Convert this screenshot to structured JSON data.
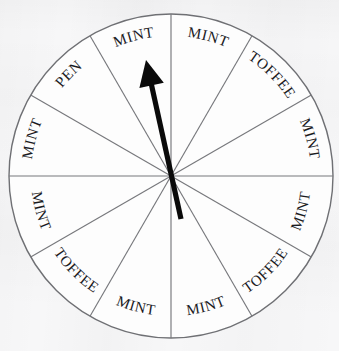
{
  "page": {
    "background_color": "#f7f7f8",
    "ink_color": "#1b1b1f",
    "line_color": "#6f7074",
    "arrow_color": "#0a0a0a"
  },
  "wheel": {
    "name": "prize-spinner-wheel",
    "center_x": 171,
    "center_y": 176,
    "radius": 162,
    "sector_count": 12,
    "sector_angle_degrees": 30,
    "outline_color": "#6f7074",
    "fill_color": "#fdfdfd",
    "sectors": [
      {
        "index": 1,
        "label": "MINT",
        "start_deg": 0,
        "end_deg": 30
      },
      {
        "index": 2,
        "label": "TOFFEE",
        "start_deg": 30,
        "end_deg": 60
      },
      {
        "index": 3,
        "label": "MINT",
        "start_deg": 60,
        "end_deg": 90
      },
      {
        "index": 4,
        "label": "MINT",
        "start_deg": 90,
        "end_deg": 120
      },
      {
        "index": 5,
        "label": "TOFFEE",
        "start_deg": 120,
        "end_deg": 150
      },
      {
        "index": 6,
        "label": "MINT",
        "start_deg": 150,
        "end_deg": 180
      },
      {
        "index": 7,
        "label": "MINT",
        "start_deg": 180,
        "end_deg": 210
      },
      {
        "index": 8,
        "label": "TOFFEE",
        "start_deg": 210,
        "end_deg": 240
      },
      {
        "index": 9,
        "label": "MINT",
        "start_deg": 240,
        "end_deg": 270
      },
      {
        "index": 10,
        "label": "MINT",
        "start_deg": 270,
        "end_deg": 300
      },
      {
        "index": 11,
        "label": "PEN",
        "start_deg": 300,
        "end_deg": 330
      },
      {
        "index": 12,
        "label": "MINT",
        "start_deg": 330,
        "end_deg": 360
      }
    ]
  },
  "pointer": {
    "name": "spinner-arrow",
    "tip_x": 146,
    "tip_y": 60,
    "tail_x": 181,
    "tail_y": 219,
    "color": "#0a0a0a",
    "points_at_sector_index": 12,
    "points_at_label": "MINT"
  },
  "chart_data": {
    "type": "pie",
    "categories": [
      "MINT",
      "TOFFEE",
      "PEN"
    ],
    "values": [
      8,
      3,
      1
    ],
    "slice_labels": [
      "MINT",
      "TOFFEE",
      "MINT",
      "MINT",
      "TOFFEE",
      "MINT",
      "MINT",
      "TOFFEE",
      "MINT",
      "MINT",
      "PEN",
      "MINT"
    ],
    "slice_angles_deg": [
      30,
      30,
      30,
      30,
      30,
      30,
      30,
      30,
      30,
      30,
      30,
      30
    ],
    "total_slices": 12,
    "legend": "none",
    "grid": false
  }
}
